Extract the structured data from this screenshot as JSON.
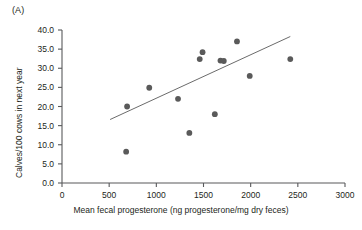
{
  "panel": {
    "label": "(A)"
  },
  "chart_data": {
    "type": "scatter",
    "title": "",
    "subtitle": "",
    "xlabel": "Mean fecal progesterone (ng progesterone/mg dry feces)",
    "ylabel": "Calves/100 cows in next year",
    "xlim": [
      0,
      3000
    ],
    "ylim": [
      0,
      40
    ],
    "xticks": [
      0,
      500,
      1000,
      1500,
      2000,
      2500,
      3000
    ],
    "xtick_labels": [
      "0",
      "500",
      "1000",
      "1500",
      "2000",
      "2500",
      "3000"
    ],
    "yticks": [
      0,
      5,
      10,
      15,
      20,
      25,
      30,
      35,
      40
    ],
    "ytick_labels": [
      "0.0",
      "5.0",
      "10.0",
      "15.0",
      "20.0",
      "25.0",
      "30.0",
      "35.0",
      "40.0"
    ],
    "grid": false,
    "legend": "none",
    "marker": {
      "shape": "circle",
      "color": "#5a5a5a",
      "size": 5
    },
    "series": [
      {
        "name": "observations",
        "points": [
          {
            "x": 680,
            "y": 8.2
          },
          {
            "x": 690,
            "y": 20.0
          },
          {
            "x": 925,
            "y": 24.9
          },
          {
            "x": 1230,
            "y": 22.0
          },
          {
            "x": 1350,
            "y": 13.1
          },
          {
            "x": 1460,
            "y": 32.4
          },
          {
            "x": 1490,
            "y": 34.2
          },
          {
            "x": 1620,
            "y": 18.0
          },
          {
            "x": 1680,
            "y": 32.0
          },
          {
            "x": 1715,
            "y": 31.9
          },
          {
            "x": 1855,
            "y": 37.0
          },
          {
            "x": 1990,
            "y": 28.0
          },
          {
            "x": 2420,
            "y": 32.4
          }
        ]
      }
    ],
    "trendline": {
      "name": "linear fit",
      "color": "#6b6b6b",
      "x0": 510,
      "y0": 16.6,
      "x1": 2420,
      "y1": 38.3
    },
    "annotations": []
  },
  "style": {
    "axis_color": "#58595b",
    "text_color": "#231f20",
    "marker_color": "#5a5a5a",
    "line_color": "#6b6b6b",
    "background": "#ffffff"
  }
}
